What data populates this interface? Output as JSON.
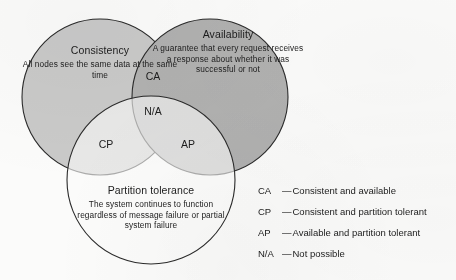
{
  "figure": {
    "type": "venn-diagram",
    "background_color": "#fbfbfa",
    "stroke_color": "#2b2b2b"
  },
  "circles": [
    {
      "id": "consistency",
      "title": "Consistency",
      "body": "All nodes see the same data at the same time",
      "fill": "#cdcdcd",
      "cx": 100,
      "cy": 97,
      "r": 78
    },
    {
      "id": "availability",
      "title": "Availability",
      "body": "A guarantee that every request receives a response about whether it was successful or not",
      "fill": "#b4b4b4",
      "cx": 210,
      "cy": 97,
      "r": 78
    },
    {
      "id": "partition-tolerance",
      "title": "Partition tolerance",
      "body": "The system continues to function regardless of message failure or partial system failure",
      "fill": "#ffffff",
      "cx": 151,
      "cy": 180,
      "r": 84
    }
  ],
  "regions": [
    {
      "id": "ca",
      "label": "CA"
    },
    {
      "id": "na",
      "label": "N/A"
    },
    {
      "id": "cp",
      "label": "CP"
    },
    {
      "id": "ap",
      "label": "AP"
    }
  ],
  "legend": {
    "separator": "—",
    "items": [
      {
        "key": "CA",
        "description": "Consistent and available"
      },
      {
        "key": "CP",
        "description": "Consistent and partition tolerant"
      },
      {
        "key": "AP",
        "description": "Available and partition tolerant"
      },
      {
        "key": "N/A",
        "description": "Not possible"
      }
    ]
  }
}
